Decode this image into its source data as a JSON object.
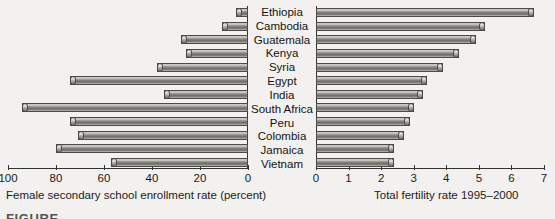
{
  "figure": {
    "caption_partial": "FIGURE"
  },
  "chart_data": {
    "type": "bar",
    "title": "",
    "orientation": "horizontal",
    "layout": "two mirrored horizontal bar panels sharing centred country labels",
    "grid": false,
    "legend": null,
    "categories": [
      "Ethiopia",
      "Cambodia",
      "Guatemala",
      "Kenya",
      "Syria",
      "Egypt",
      "India",
      "South Africa",
      "Peru",
      "Colombia",
      "Jamaica",
      "Vietnam"
    ],
    "panels": [
      {
        "name": "female-secondary-enrollment",
        "position": "left",
        "xlabel": "Female secondary school enrollment rate (percent)",
        "direction": "right-to-left (values increase leftwards)",
        "xlim": [
          100,
          0
        ],
        "ticks": [
          100,
          80,
          60,
          40,
          20,
          0
        ],
        "ticklabels": [
          "100",
          "80",
          "60",
          "40",
          "20",
          "0"
        ],
        "values": [
          5,
          11,
          28,
          26,
          38,
          74,
          35,
          94,
          74,
          71,
          80,
          57
        ]
      },
      {
        "name": "total-fertility-rate",
        "position": "right",
        "xlabel": "Total fertility rate 1995–2000",
        "direction": "left-to-right",
        "xlim": [
          0,
          7
        ],
        "ticks": [
          0,
          1,
          2,
          3,
          4,
          5,
          6,
          7
        ],
        "ticklabels": [
          "0",
          "1",
          "2",
          "3",
          "4",
          "5",
          "6",
          "7"
        ],
        "values": [
          6.7,
          5.2,
          4.9,
          4.4,
          3.9,
          3.4,
          3.3,
          3.0,
          2.9,
          2.7,
          2.4,
          2.4
        ]
      }
    ]
  },
  "colors": {
    "background": "#f2f1ef",
    "bar_light": "#d8d6d2",
    "bar_dark": "#6d6b67",
    "axis": "#35332f",
    "text": "#1d1b19"
  }
}
